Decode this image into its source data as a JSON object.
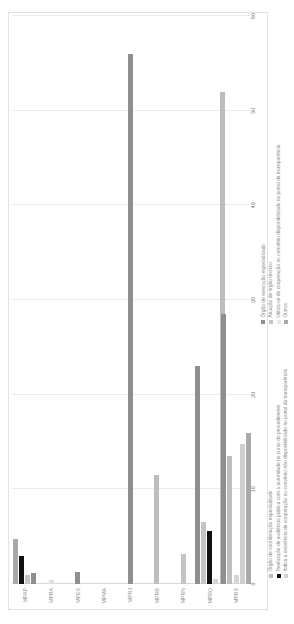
{
  "chart_data": {
    "type": "bar",
    "orientation": "horizontal",
    "title": "",
    "xlabel": "",
    "ylabel": "",
    "xlim": [
      0,
      60
    ],
    "xticks": [
      0,
      10,
      20,
      30,
      40,
      50,
      60
    ],
    "xtick_labels": [
      "0",
      "10",
      "20",
      "30",
      "40",
      "50",
      "60"
    ],
    "grid": true,
    "legend_position": "bottom",
    "categories": [
      "MPAP",
      "MPBA",
      "MPES",
      "MPMA",
      "MPRJ",
      "MPRR",
      "MPRN",
      "MPRO",
      "MPRS"
    ],
    "series": [
      {
        "name": "Órgão de execução especializado",
        "color": "#8f8f8f",
        "values": [
          1.2,
          0,
          1.3,
          0,
          56.0,
          0,
          0.7,
          23.0,
          0
        ]
      },
      {
        "name": "Atuação de órgão técnico",
        "color": "#c4c4c4",
        "values": [
          1.0,
          0.4,
          0,
          0,
          0,
          0,
          3.2,
          6.5,
          0
        ]
      },
      {
        "name": "Utiliza-se de cooperação ou convênio disponibilizado no portal da transparência",
        "color": "#e8e8e8",
        "values": [
          0,
          0,
          0,
          0,
          0,
          0,
          0,
          0,
          0
        ]
      },
      {
        "name": "Outros",
        "color": "#a9a9a9",
        "values": [
          4.8,
          0,
          0,
          0,
          0,
          0,
          0,
          0,
          0
        ]
      },
      {
        "name": "Órgão de coordenação especializado",
        "color": "#bdbdbd",
        "values": [
          0,
          0,
          0,
          0,
          0,
          11.5,
          0,
          52.0,
          13.5
        ]
      },
      {
        "name": "Realização de audiência pública com a autoridade no curso do procedimento",
        "color": "#111111",
        "values": [
          3.0,
          0,
          0,
          0,
          0,
          0,
          0,
          5.6,
          0
        ]
      },
      {
        "name": "Indica a existência de cooperação ou convênio não disponibilizado no portal da transparência",
        "color": "#d5d5d5",
        "values": [
          0,
          0,
          0,
          0,
          0,
          0,
          0,
          0.5,
          1.0
        ]
      }
    ],
    "bar_groups": [
      {
        "category": "MPAP",
        "bars": [
          {
            "series": "Outros",
            "value": 4.8,
            "color": "#a9a9a9"
          },
          {
            "series": "Realização de audiência pública com a autoridade no curso do procedimento",
            "value": 3.0,
            "color": "#111111"
          },
          {
            "series": "Atuação de órgão técnico",
            "value": 1.0,
            "color": "#c4c4c4"
          },
          {
            "series": "Órgão de execução especializado",
            "value": 1.2,
            "color": "#8f8f8f"
          }
        ]
      },
      {
        "category": "MPBA",
        "bars": [
          {
            "series": "Atuação de órgão técnico",
            "value": 0.4,
            "color": "#e0e0e0"
          }
        ]
      },
      {
        "category": "MPES",
        "bars": [
          {
            "series": "Órgão de execução especializado",
            "value": 1.3,
            "color": "#8f8f8f"
          }
        ]
      },
      {
        "category": "MPMA",
        "bars": []
      },
      {
        "category": "MPRJ",
        "bars": [
          {
            "series": "Órgão de execução especializado",
            "value": 56.0,
            "color": "#8f8f8f"
          }
        ]
      },
      {
        "category": "MPRR",
        "bars": [
          {
            "series": "Órgão de coordenação especializado",
            "value": 11.5,
            "color": "#bdbdbd"
          }
        ]
      },
      {
        "category": "MPRN",
        "bars": [
          {
            "series": "Atuação de órgão técnico",
            "value": 3.2,
            "color": "#c4c4c4"
          }
        ]
      },
      {
        "category": "MPRO",
        "bars": [
          {
            "series": "Órgão de execução especializado",
            "value": 23.0,
            "color": "#8f8f8f"
          },
          {
            "series": "Atuação de órgão técnico",
            "value": 6.5,
            "color": "#c4c4c4"
          },
          {
            "series": "Realização de audiência pública com a autoridade no curso do procedimento",
            "value": 5.6,
            "color": "#111111"
          },
          {
            "series": "Indica a existência de cooperação ou convênio não disponibilizado no portal da transparência",
            "value": 0.5,
            "color": "#d5d5d5"
          },
          {
            "series": "Órgão de coordenação especializado",
            "value": 52.0,
            "color": "#bdbdbd"
          }
        ]
      },
      {
        "category": "MPRS",
        "bars": [
          {
            "series": "Órgão de execução especializado",
            "value": 28.5,
            "color": "#8f8f8f"
          },
          {
            "series": "Órgão de coordenação especializado",
            "value": 13.5,
            "color": "#bdbdbd"
          },
          {
            "series": "Indica a existência de cooperação ou convênio não disponibilizado no portal da transparência",
            "value": 1.0,
            "color": "#d5d5d5"
          },
          {
            "series": "Atuação de órgão técnico",
            "value": 14.8,
            "color": "#cfcfcf"
          },
          {
            "series": "Outros",
            "value": 16.0,
            "color": "#a9a9a9"
          }
        ]
      }
    ],
    "legends": [
      {
        "id": "legend-top",
        "items": [
          {
            "label": "Órgão de coordenação especializado",
            "color": "#bdbdbd"
          },
          {
            "label": "Realização de audiência pública com a autoridade no curso do procedimento",
            "color": "#111111"
          },
          {
            "label": "Indica a existência de cooperação ou convênio não disponibilizado no portal da transparência",
            "color": "#d5d5d5"
          }
        ]
      },
      {
        "id": "legend-bottom",
        "items": [
          {
            "label": "Órgão de execução especializado",
            "color": "#8f8f8f"
          },
          {
            "label": "Atuação de órgão técnico",
            "color": "#c4c4c4"
          },
          {
            "label": "Utiliza-se de cooperação ou convênio disponibilizado no portal da transparência",
            "color": "#e8e8e8"
          },
          {
            "label": "Outros",
            "color": "#a9a9a9"
          }
        ]
      }
    ]
  }
}
